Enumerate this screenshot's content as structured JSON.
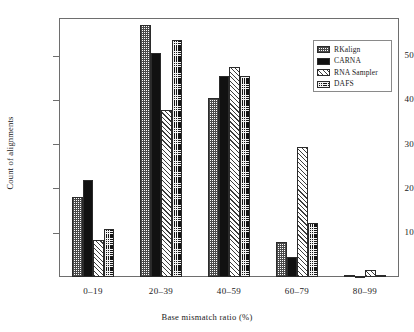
{
  "chart_data": {
    "type": "bar",
    "title": "",
    "subtitle": "",
    "xlabel": "Base  mismatch ratio (%)",
    "ylabel": "Count of alignments",
    "categories": [
      "0–19",
      "20–39",
      "40–59",
      "60–79",
      "80–99"
    ],
    "series": [
      {
        "name": "RKalign",
        "pattern": "light-checker",
        "values": [
          18.0,
          57.0,
          40.5,
          7.8,
          0.5
        ]
      },
      {
        "name": "CARNA",
        "pattern": "solid-black",
        "values": [
          21.8,
          50.5,
          45.3,
          4.6,
          0.3
        ]
      },
      {
        "name": "RNA Sampler",
        "pattern": "diagonal-hatch",
        "values": [
          8.3,
          37.8,
          47.5,
          29.3,
          1.5
        ]
      },
      {
        "name": "DAFS",
        "pattern": "dark-checker",
        "values": [
          10.8,
          53.5,
          45.3,
          12.2,
          0.4
        ]
      }
    ],
    "yticks": [
      10,
      20,
      30,
      40,
      50
    ],
    "ytick_labels": [
      "10",
      "20",
      "30",
      "40",
      "50"
    ],
    "ylim": [
      0,
      58.5
    ],
    "grid": false,
    "legend_position": "top-right",
    "legend_entries": [
      "RKalign",
      "CARNA",
      "RNA Sampler",
      "DAFS"
    ],
    "axis_color": "#6e6e6e",
    "bar_edge_color": "#2b2b2b",
    "background_color": "#ffffff",
    "text_color": "#1a1a1a"
  }
}
